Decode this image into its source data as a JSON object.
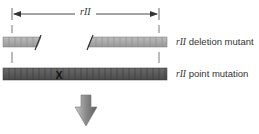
{
  "diagram": {
    "region_label": "rII",
    "rows": [
      {
        "gene": "rII",
        "label": "deletion mutant",
        "type": "deletion"
      },
      {
        "gene": "rII",
        "label": "point mutation",
        "type": "point",
        "mark": "X"
      }
    ],
    "arrow": "down-arrow"
  },
  "colors": {
    "deletion_bar": "#a9a9a9",
    "point_bar": "#5a5a5a",
    "arrow_fill": "#8a8a8a"
  }
}
